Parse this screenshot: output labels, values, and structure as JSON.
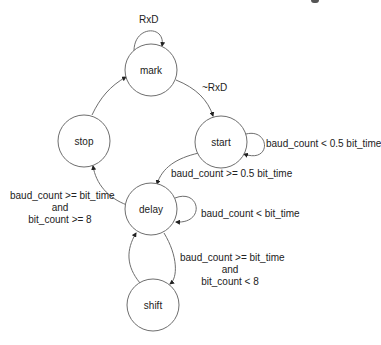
{
  "diagram": {
    "type": "state-machine",
    "states": [
      {
        "id": "mark",
        "label": "mark"
      },
      {
        "id": "start",
        "label": "start"
      },
      {
        "id": "stop",
        "label": "stop"
      },
      {
        "id": "delay",
        "label": "delay"
      },
      {
        "id": "shift",
        "label": "shift"
      }
    ],
    "transitions": [
      {
        "from": "mark",
        "to": "mark",
        "label": "RxD"
      },
      {
        "from": "mark",
        "to": "start",
        "label": "~RxD"
      },
      {
        "from": "start",
        "to": "start",
        "label": "baud_count < 0.5 bit_time"
      },
      {
        "from": "start",
        "to": "delay",
        "label": "baud_count >= 0.5 bit_time"
      },
      {
        "from": "delay",
        "to": "delay",
        "label": "baud_count < bit_time"
      },
      {
        "from": "delay",
        "to": "stop",
        "label_lines": [
          "baud_count >= bit_time",
          "and",
          "bit_count >= 8"
        ]
      },
      {
        "from": "delay",
        "to": "shift",
        "label_lines": [
          "baud_count >= bit_time",
          "and",
          "bit_count < 8"
        ]
      },
      {
        "from": "shift",
        "to": "delay",
        "label": ""
      },
      {
        "from": "stop",
        "to": "mark",
        "label": ""
      }
    ]
  }
}
